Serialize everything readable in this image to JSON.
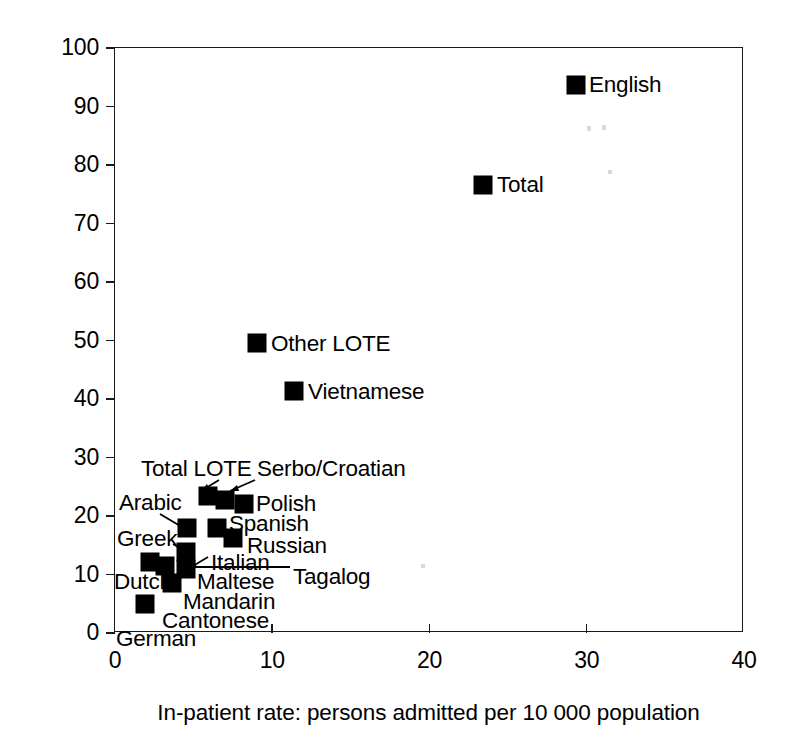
{
  "chart_data": {
    "type": "scatter",
    "title": "",
    "xlabel": "In-patient rate: persons admitted per 10 000 population",
    "ylabel": "Out-patient rate: persons registered per 10 000 population",
    "xlim": [
      0,
      40
    ],
    "ylim": [
      0,
      100
    ],
    "xticks": [
      0,
      10,
      20,
      30,
      40
    ],
    "yticks": [
      0,
      10,
      20,
      30,
      40,
      50,
      60,
      70,
      80,
      90,
      100
    ],
    "grid": false,
    "legend": "none",
    "marker_style": "filled-square",
    "marker_color": "#000000",
    "points": [
      {
        "label": "English",
        "x": 29.3,
        "y": 93.6,
        "label_pos": "right"
      },
      {
        "label": "Total",
        "x": 23.4,
        "y": 76.6,
        "label_pos": "right"
      },
      {
        "label": "Other LOTE",
        "x": 9.0,
        "y": 49.6,
        "label_pos": "right"
      },
      {
        "label": "Vietnamese",
        "x": 11.4,
        "y": 41.4,
        "label_pos": "right"
      },
      {
        "label": "Total LOTE",
        "x": 5.9,
        "y": 23.4,
        "label_pos": "leader-upper-left"
      },
      {
        "label": "Serbo/Croatian",
        "x": 7.0,
        "y": 22.7,
        "label_pos": "leader-upper-right"
      },
      {
        "label": "Polish",
        "x": 8.2,
        "y": 22.1,
        "label_pos": "right"
      },
      {
        "label": "Arabic",
        "x": 4.6,
        "y": 17.9,
        "label_pos": "leader-left"
      },
      {
        "label": "Spanish",
        "x": 6.5,
        "y": 17.9,
        "label_pos": "upper-right"
      },
      {
        "label": "Russian",
        "x": 7.5,
        "y": 16.2,
        "label_pos": "right"
      },
      {
        "label": "Greek",
        "x": 4.5,
        "y": 13.8,
        "label_pos": "leader-left"
      },
      {
        "label": "Italian",
        "x": 4.5,
        "y": 10.9,
        "label_pos": "leader-right"
      },
      {
        "label": "Tagalog",
        "x": 3.2,
        "y": 11.5,
        "label_pos": "leader-right-long"
      },
      {
        "label": "Maltese",
        "x": 2.2,
        "y": 12.1,
        "label_pos": "below-right"
      },
      {
        "label": "Dutch",
        "x": 3.6,
        "y": 8.5,
        "label_pos": "left"
      },
      {
        "label": "Mandarin",
        "x": 3.6,
        "y": 8.5,
        "label_pos": "below-right"
      },
      {
        "label": "Cantonese",
        "x": 1.9,
        "y": 5.0,
        "label_pos": "right"
      },
      {
        "label": "German",
        "x": 1.9,
        "y": 5.0,
        "label_pos": "below-left"
      }
    ]
  },
  "axis": {
    "y_title": "Out-patient rate: persons registered per 10 000 population",
    "x_title": "In-patient rate: persons admitted per 10 000 population",
    "y_tick_labels": [
      "0",
      "10",
      "20",
      "30",
      "40",
      "50",
      "60",
      "70",
      "80",
      "90",
      "100"
    ],
    "x_tick_labels": [
      "0",
      "10",
      "20",
      "30",
      "40"
    ]
  },
  "labels": {
    "english": "English",
    "total": "Total",
    "other_lote": "Other LOTE",
    "vietnamese": "Vietnamese",
    "total_lote": "Total LOTE",
    "serbo_croatian": "Serbo/Croatian",
    "polish": "Polish",
    "arabic": "Arabic",
    "spanish": "Spanish",
    "russian": "Russian",
    "greek": "Greek",
    "italian": "Italian",
    "tagalog": "Tagalog",
    "maltese": "Maltese",
    "dutch": "Dutch",
    "mandarin": "Mandarin",
    "cantonese": "Cantonese",
    "german": "German"
  }
}
